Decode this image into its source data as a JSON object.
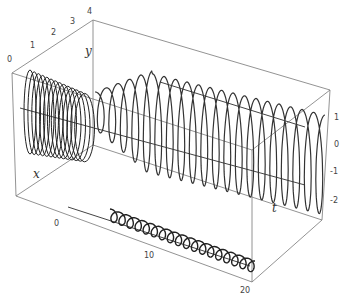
{
  "chart_data": {
    "type": "line",
    "subtype": "3d-parametric-curve",
    "title": "",
    "axes": {
      "x": {
        "label": "x",
        "ticks": [],
        "range": [
          -2,
          2
        ]
      },
      "y": {
        "label": "y",
        "ticks": [
          "0",
          "1",
          "2",
          "3",
          "4"
        ],
        "range": [
          0,
          4
        ]
      },
      "t": {
        "label": "t",
        "ticks": [
          "0",
          "10",
          "20"
        ],
        "range": [
          0,
          20
        ]
      },
      "vertical": {
        "label": "",
        "ticks": [
          "1",
          "0",
          "-1",
          "-2"
        ],
        "range": [
          -2.5,
          2
        ]
      }
    },
    "series": [
      {
        "name": "main helix",
        "description": "oscillating curve in 3D, dense near t=0 with growing amplitude then steady oscillation to t=20",
        "periods": 20
      },
      {
        "name": "projection on floor",
        "description": "zig-zag projected trace along t axis on bottom face"
      }
    ],
    "grid": false,
    "legend": null,
    "box": true
  },
  "labels": {
    "x": "x",
    "y": "y",
    "t": "t",
    "y_ticks": [
      "0",
      "1",
      "2",
      "3",
      "4"
    ],
    "t_ticks": [
      "0",
      "10",
      "20"
    ],
    "v_ticks": [
      "1",
      "0",
      "-1",
      "-2"
    ]
  }
}
